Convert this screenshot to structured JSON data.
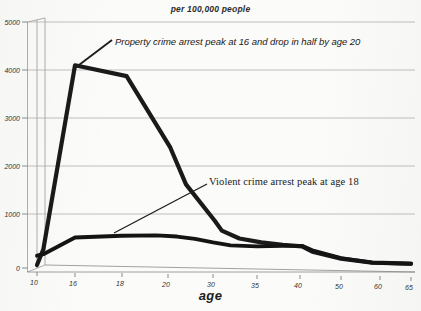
{
  "chart_data": {
    "type": "line",
    "title": "per 100,000 people",
    "xlabel": "age",
    "ylabel": "",
    "ylim": [
      0,
      5000
    ],
    "ytick_values": [
      0,
      1000,
      2000,
      3000,
      4000,
      5000
    ],
    "ytick_labels": [
      "0",
      "1000",
      "2000",
      "3000",
      "4000",
      "5000"
    ],
    "grid": true,
    "legend_position": "none",
    "x": [
      10,
      16,
      18,
      20,
      30,
      35,
      40,
      50,
      60,
      65
    ],
    "xtick_labels": [
      "10",
      "16",
      "18",
      "20",
      "30",
      "35",
      "40",
      "50",
      "60",
      "65"
    ],
    "series": [
      {
        "name": "Property crime arrest rate",
        "color": "#1a1a1a",
        "x": [
          10,
          11,
          16,
          18.2,
          20.5,
          24,
          30.2,
          31,
          33,
          35.5,
          38,
          40.5,
          43,
          50,
          58,
          65
        ],
        "values": [
          60,
          380,
          4120,
          3900,
          2450,
          1700,
          960,
          760,
          600,
          520,
          470,
          440,
          330,
          190,
          110,
          90
        ]
      },
      {
        "name": "Violent crime arrest rate",
        "color": "#141414",
        "x": [
          10,
          11,
          16,
          18,
          19.5,
          22,
          26,
          30,
          32,
          35,
          38,
          40.5,
          43,
          50,
          58,
          65
        ],
        "values": [
          250,
          280,
          620,
          655,
          665,
          640,
          590,
          520,
          460,
          440,
          450,
          450,
          360,
          200,
          110,
          85
        ]
      }
    ],
    "annotations": [
      {
        "id": "property-annotation",
        "text": "Property crime arrest peak at 16 and drop in half by  age 20",
        "font": "sans-italic",
        "leader_from": [
          75,
          68
        ],
        "leader_to": [
          112,
          40
        ]
      },
      {
        "id": "violent-annotation",
        "text": "Violent crime arrest peak at age 18",
        "font": "serif",
        "leader_from": [
          114,
          233
        ],
        "leader_to": [
          207,
          184
        ]
      }
    ]
  },
  "chart": {
    "title": "per 100,000 people",
    "xlabel": "age",
    "property_annotation": "Property crime arrest peak at 16 and drop in half by  age 20",
    "violent_annotation": "Violent crime arrest peak at age 18"
  },
  "axes": {
    "y_labels": [
      "5000",
      "4000",
      "3000",
      "2000",
      "1000",
      "0"
    ],
    "x_labels": [
      "10",
      "16",
      "18",
      "20",
      "30",
      "35",
      "40",
      "50",
      "60",
      "65"
    ]
  },
  "colors": {
    "line": "#1a1a1a",
    "grid": "#aaaaaa",
    "background": "#fbfbf9",
    "text": "#222222"
  }
}
